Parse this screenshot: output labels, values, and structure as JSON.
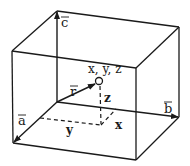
{
  "diagram": {
    "type": "parallelepiped coordinate diagram",
    "vectors": [
      {
        "name": "a",
        "label": "a",
        "has_arrow_overline": true
      },
      {
        "name": "b",
        "label": "b",
        "has_arrow_overline": true
      },
      {
        "name": "c",
        "label": "c",
        "has_arrow_overline": true
      },
      {
        "name": "r",
        "label": "r",
        "has_arrow_overline": true
      }
    ],
    "point": {
      "label": "x, y, z"
    },
    "components": {
      "x": "x",
      "y": "y",
      "z": "z"
    },
    "colors": {
      "ink": "#1a1a1a",
      "background": "#ffffff"
    }
  }
}
